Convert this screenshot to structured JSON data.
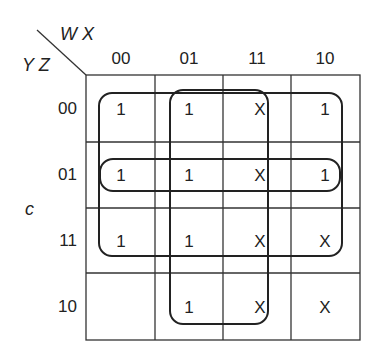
{
  "kmap": {
    "corner": {
      "col_vars": "W X",
      "row_vars": "Y Z"
    },
    "side_label": "c",
    "col_headers": [
      "00",
      "01",
      "11",
      "10"
    ],
    "row_headers": [
      "00",
      "01",
      "11",
      "10"
    ],
    "cells": [
      [
        "1",
        "1",
        "X",
        "1"
      ],
      [
        "1",
        "1",
        "X",
        "1"
      ],
      [
        "1",
        "1",
        "X",
        "X"
      ],
      [
        "",
        "1",
        "X",
        "X"
      ]
    ],
    "loops": [
      {
        "name": "rows-00-11-cols-00-10",
        "desc": "Top three rows, all columns"
      },
      {
        "name": "cols-01-11",
        "desc": "Middle two columns, all rows"
      },
      {
        "name": "row-01",
        "desc": "Row 01, all columns"
      }
    ]
  }
}
